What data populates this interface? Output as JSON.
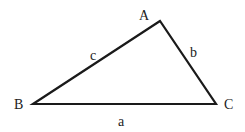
{
  "diagram": {
    "type": "triangle",
    "vertices": [
      {
        "label": "A",
        "x": 160,
        "y": 21
      },
      {
        "label": "B",
        "x": 33,
        "y": 104
      },
      {
        "label": "C",
        "x": 216,
        "y": 104
      }
    ],
    "sides": [
      {
        "label": "a",
        "between": "B-C"
      },
      {
        "label": "b",
        "between": "A-C"
      },
      {
        "label": "c",
        "between": "A-B"
      }
    ],
    "stroke_color": "#1a1a1a"
  }
}
